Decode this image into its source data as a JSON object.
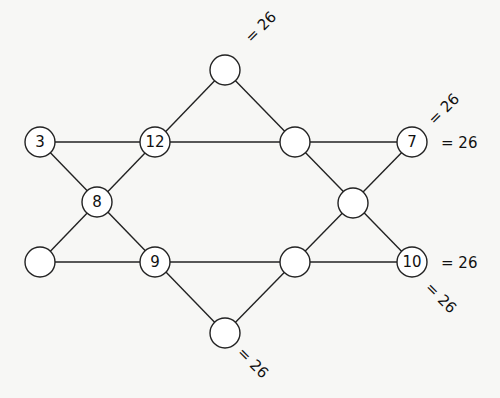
{
  "puzzle": {
    "title": "",
    "target_sum": "26",
    "nodes": [
      {
        "id": "top",
        "value": "",
        "x": 225,
        "y": 70
      },
      {
        "id": "a",
        "value": "3",
        "x": 40,
        "y": 142
      },
      {
        "id": "b",
        "value": "12",
        "x": 155,
        "y": 142
      },
      {
        "id": "c",
        "value": "",
        "x": 295,
        "y": 142
      },
      {
        "id": "d",
        "value": "7",
        "x": 412,
        "y": 142
      },
      {
        "id": "e",
        "value": "8",
        "x": 97,
        "y": 202
      },
      {
        "id": "f",
        "value": "",
        "x": 353,
        "y": 203
      },
      {
        "id": "g",
        "value": "",
        "x": 40,
        "y": 262
      },
      {
        "id": "h",
        "value": "9",
        "x": 155,
        "y": 262
      },
      {
        "id": "i",
        "value": "",
        "x": 295,
        "y": 262
      },
      {
        "id": "j",
        "value": "10",
        "x": 412,
        "y": 262
      },
      {
        "id": "bottom",
        "value": "",
        "x": 225,
        "y": 333
      }
    ],
    "sum_labels": [
      {
        "id": "sum-top-diag",
        "text": "= 26"
      },
      {
        "id": "sum-row1",
        "text": "= 26"
      },
      {
        "id": "sum-right-diag-up",
        "text": "= 26"
      },
      {
        "id": "sum-row2",
        "text": "= 26"
      },
      {
        "id": "sum-right-diag-down",
        "text": "= 26"
      },
      {
        "id": "sum-bottom-diag",
        "text": "= 26"
      }
    ]
  }
}
